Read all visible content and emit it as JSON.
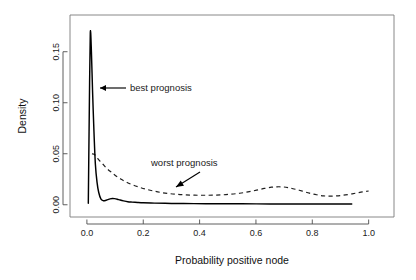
{
  "chart_data": {
    "type": "line",
    "title": "",
    "xlabel": "Probability positive node",
    "ylabel": "Density",
    "xlim": [
      -0.06,
      1.09
    ],
    "ylim": [
      -0.012,
      0.186
    ],
    "grid": false,
    "legend": "none",
    "xticks": [
      0.0,
      0.2,
      0.4,
      0.6,
      0.8,
      1.0
    ],
    "xtick_labels": [
      "0.0",
      "0.2",
      "0.4",
      "0.6",
      "0.8",
      "1.0"
    ],
    "yticks": [
      0.0,
      0.05,
      0.1,
      0.15
    ],
    "ytick_labels": [
      "0.00",
      "0.05",
      "0.10",
      "0.15"
    ],
    "series": [
      {
        "name": "best prognosis",
        "style": "solid",
        "color": "#000000",
        "x": [
          0.005,
          0.008,
          0.012,
          0.016,
          0.02,
          0.025,
          0.03,
          0.036,
          0.042,
          0.05,
          0.058,
          0.066,
          0.074,
          0.082,
          0.09,
          0.098,
          0.108,
          0.118,
          0.13,
          0.145,
          0.16,
          0.18,
          0.2,
          0.24,
          0.3,
          0.38,
          0.46,
          0.55,
          0.65,
          0.75,
          0.85,
          0.94
        ],
        "y": [
          0.0015,
          0.08,
          0.168,
          0.15,
          0.112,
          0.072,
          0.04,
          0.022,
          0.012,
          0.0055,
          0.004,
          0.0042,
          0.005,
          0.0058,
          0.0062,
          0.006,
          0.0054,
          0.0046,
          0.0038,
          0.003,
          0.0026,
          0.0022,
          0.0019,
          0.0016,
          0.0013,
          0.0011,
          0.001,
          0.0009,
          0.0008,
          0.0008,
          0.0007,
          0.0007
        ]
      },
      {
        "name": "worst prognosis",
        "style": "dashed",
        "color": "#1f1f1f",
        "x": [
          0.018,
          0.026,
          0.034,
          0.044,
          0.056,
          0.07,
          0.086,
          0.102,
          0.12,
          0.14,
          0.162,
          0.186,
          0.21,
          0.236,
          0.262,
          0.29,
          0.32,
          0.35,
          0.382,
          0.414,
          0.446,
          0.478,
          0.51,
          0.542,
          0.572,
          0.602,
          0.63,
          0.655,
          0.675,
          0.695,
          0.715,
          0.74,
          0.765,
          0.79,
          0.815,
          0.84,
          0.862,
          0.884,
          0.906,
          0.93,
          0.955,
          0.978,
          1.0
        ],
        "y": [
          0.05,
          0.0495,
          0.047,
          0.0435,
          0.04,
          0.0358,
          0.032,
          0.0285,
          0.0252,
          0.0222,
          0.0195,
          0.0172,
          0.0152,
          0.0135,
          0.0121,
          0.011,
          0.0102,
          0.0097,
          0.0094,
          0.0093,
          0.0094,
          0.0097,
          0.0103,
          0.0113,
          0.0126,
          0.0143,
          0.016,
          0.0172,
          0.0176,
          0.0175,
          0.0168,
          0.0152,
          0.0133,
          0.0114,
          0.0098,
          0.0087,
          0.0084,
          0.0086,
          0.0092,
          0.0102,
          0.0114,
          0.0126,
          0.0135
        ]
      }
    ],
    "annotations": [
      {
        "text": "best prognosis",
        "label_x_px": 130,
        "label_y_px": 91,
        "arrow_from_px": [
          126,
          88
        ],
        "arrow_to_px": [
          100,
          88
        ],
        "arrow_type": "straight-left"
      },
      {
        "text": "worst prognosis",
        "label_x_px": 151,
        "label_y_px": 166,
        "arrow_from_px": [
          200,
          172
        ],
        "arrow_to_px": [
          176,
          187
        ],
        "arrow_type": "diagonal-down-left"
      }
    ]
  },
  "axes": {
    "x_title": "Probability positive node",
    "y_title": "Density",
    "x_tick_labels": [
      "0.0",
      "0.2",
      "0.4",
      "0.6",
      "0.8",
      "1.0"
    ],
    "y_tick_labels": [
      "0.00",
      "0.05",
      "0.10",
      "0.15"
    ]
  },
  "annotations": {
    "best": "best prognosis",
    "worst": "worst prognosis"
  },
  "colors": {
    "background": "#ffffff",
    "solid_curve": "#000000",
    "dashed_curve": "#1f1f1f",
    "axis": "#4d4d4d",
    "box": "#7a7a7a",
    "text": "#1a1a1a"
  }
}
